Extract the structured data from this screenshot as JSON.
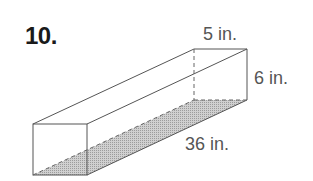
{
  "problem_number": "10.",
  "figure": {
    "shape": "rectangular-prism",
    "labels": {
      "width": "5 in.",
      "height": "6 in.",
      "length": "36 in."
    },
    "colors": {
      "edge": "#555555",
      "shaded_base": "#b5b5b5"
    }
  }
}
